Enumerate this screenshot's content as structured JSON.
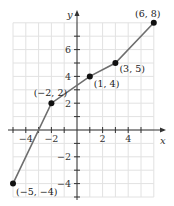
{
  "chart_data": {
    "type": "line",
    "title": "",
    "xlabel": "x",
    "ylabel": "y",
    "xlim": [
      -5,
      6
    ],
    "ylim": [
      -5,
      8
    ],
    "grid": true,
    "series": [
      {
        "name": "piecewise linear",
        "points": [
          {
            "x": -5,
            "y": -4,
            "label": "(−5, −4)"
          },
          {
            "x": -2,
            "y": 2,
            "label": "(−2, 2)"
          },
          {
            "x": 1,
            "y": 4,
            "label": "(1, 4)"
          },
          {
            "x": 3,
            "y": 5,
            "label": "(3, 5)"
          },
          {
            "x": 6,
            "y": 8,
            "label": "(6, 8)"
          }
        ]
      }
    ],
    "x_tick_labels": [
      {
        "value": -4,
        "label": "−4"
      },
      {
        "value": -2,
        "label": "−2"
      },
      {
        "value": 2,
        "label": "2"
      },
      {
        "value": 4,
        "label": "4"
      }
    ],
    "y_tick_labels": [
      {
        "value": 2,
        "label": "2"
      },
      {
        "value": 4,
        "label": "4"
      },
      {
        "value": 6,
        "label": "6"
      },
      {
        "value": -2,
        "label": "−2"
      },
      {
        "value": -4,
        "label": "−4"
      }
    ],
    "colors": {
      "line": "#6e6e6e",
      "point": "#111111",
      "grid": "#e2e2e2",
      "axis": "#333333"
    }
  }
}
